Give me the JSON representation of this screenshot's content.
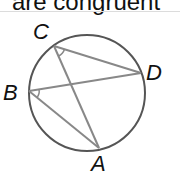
{
  "caption": "are congruent",
  "diagram": {
    "circle": {
      "cx": 87,
      "cy": 93,
      "r": 58,
      "stroke": "#555555"
    },
    "points": {
      "A": {
        "x": 99,
        "y": 148,
        "label": "A",
        "lx": 92,
        "ly": 172
      },
      "B": {
        "x": 29,
        "y": 91,
        "label": "B",
        "lx": 3,
        "ly": 100
      },
      "C": {
        "x": 54,
        "y": 46,
        "label": "C",
        "lx": 33,
        "ly": 39
      },
      "D": {
        "x": 141,
        "y": 73,
        "label": "D",
        "lx": 147,
        "ly": 80
      }
    },
    "chords": [
      [
        "C",
        "A"
      ],
      [
        "C",
        "D"
      ],
      [
        "B",
        "D"
      ],
      [
        "B",
        "A"
      ]
    ],
    "angle_marks": [
      "ACD",
      "ABD"
    ],
    "chord_color": "#888888"
  }
}
